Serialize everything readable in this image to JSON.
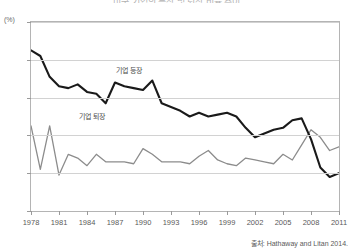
{
  "title": "미국 기업의 등장 및 퇴장 비율 추이",
  "unit_label": "(%)",
  "source_note": "출처: Hathaway and Litan 2014.",
  "series_labels": {
    "entry": "기업 등장",
    "exit": "기업 퇴장"
  },
  "colors": {
    "entry": "#1a1a1a",
    "exit": "#8c8c8c",
    "grid": "#d2d2d2",
    "frame": "#b4b4b4",
    "text": "#5a5a5a"
  },
  "chart_data": {
    "type": "line",
    "title": "미국 기업의 등장 및 퇴장 비율 추이",
    "xlabel": "",
    "ylabel": "(%)",
    "xlim": [
      1978,
      2011
    ],
    "ylim": [
      6,
      16
    ],
    "yticks": [
      6,
      8,
      10,
      12,
      14,
      16
    ],
    "xticks": [
      1978,
      1981,
      1984,
      1987,
      1990,
      1993,
      1996,
      1999,
      2002,
      2005,
      2008,
      2011
    ],
    "grid": true,
    "legend": "inline-labels",
    "x": [
      1978,
      1979,
      1980,
      1981,
      1982,
      1983,
      1984,
      1985,
      1986,
      1987,
      1988,
      1989,
      1990,
      1991,
      1992,
      1993,
      1994,
      1995,
      1996,
      1997,
      1998,
      1999,
      2000,
      2001,
      2002,
      2003,
      2004,
      2005,
      2006,
      2007,
      2008,
      2009,
      2010,
      2011
    ],
    "series": [
      {
        "name": "기업 등장",
        "values": [
          14.5,
          14.2,
          13.1,
          12.6,
          12.5,
          12.7,
          12.3,
          12.2,
          11.7,
          12.8,
          12.6,
          12.5,
          12.4,
          12.9,
          11.7,
          11.5,
          11.3,
          11.0,
          11.2,
          11.0,
          11.1,
          11.2,
          11.0,
          10.4,
          9.9,
          10.1,
          10.3,
          10.4,
          10.8,
          10.9,
          9.8,
          8.3,
          7.8,
          8.0
        ]
      },
      {
        "name": "기업 퇴장",
        "values": [
          10.5,
          8.2,
          10.5,
          7.9,
          9.0,
          8.8,
          8.4,
          9.0,
          8.6,
          8.6,
          8.6,
          8.5,
          9.3,
          9.0,
          8.6,
          8.6,
          8.6,
          8.5,
          8.9,
          9.2,
          8.7,
          8.5,
          8.4,
          8.8,
          8.7,
          8.6,
          8.5,
          9.0,
          8.7,
          9.5,
          10.3,
          9.9,
          9.2,
          9.4
        ]
      }
    ]
  }
}
